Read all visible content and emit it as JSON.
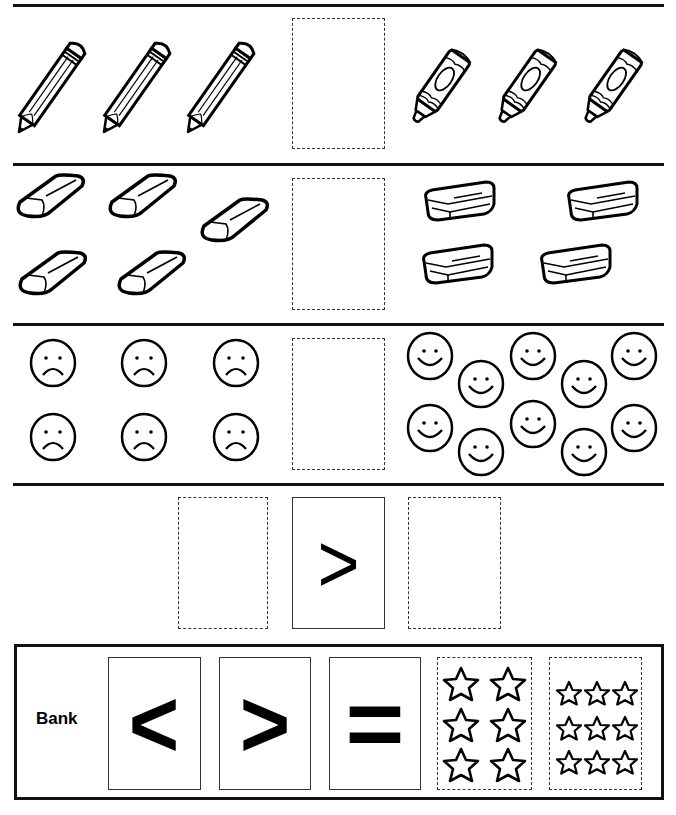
{
  "worksheet": {
    "type": "comparison-symbols",
    "rows": [
      {
        "left": {
          "object": "pencil",
          "count": 3
        },
        "answer_box": "",
        "right": {
          "object": "crayon",
          "count": 3
        }
      },
      {
        "left": {
          "object": "eraser",
          "count": 5
        },
        "answer_box": "",
        "right": {
          "object": "box",
          "count": 4
        }
      },
      {
        "left": {
          "object": "sad-face",
          "count": 6
        },
        "answer_box": "",
        "right": {
          "object": "smiley-face",
          "count": 10
        }
      },
      {
        "left_box": "",
        "symbol": ">",
        "right_box": ""
      }
    ],
    "bank": {
      "label": "Bank",
      "cards": [
        {
          "symbol": "<"
        },
        {
          "symbol": ">"
        },
        {
          "symbol": "="
        },
        {
          "object": "star",
          "count": 6
        },
        {
          "object": "star",
          "count": 9
        }
      ]
    }
  }
}
